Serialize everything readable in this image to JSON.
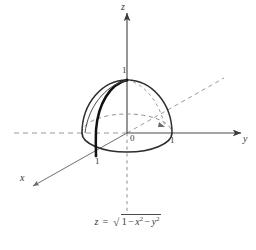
{
  "figure": {
    "kind": "3d-coordinate-axes-with-hemisphere",
    "background_color": "#ffffff",
    "line_color": "#4a4a4a",
    "dashed_color": "#8a8a8a",
    "bold_curve_color": "#1a1a1a",
    "axes": {
      "z": {
        "label": "z",
        "positive_style": "solid",
        "negative_style": "dashed",
        "arrow": true
      },
      "y": {
        "label": "y",
        "positive_style": "solid",
        "negative_style": "dashed",
        "arrow": true
      },
      "x": {
        "label": "x",
        "positive_style": "solid",
        "negative_style": "dashed",
        "arrow": true
      }
    },
    "origin_label": "0",
    "ticks": {
      "z_one": "1",
      "y_one": "1",
      "x_one": "1"
    },
    "surface": {
      "name": "upper unit hemisphere",
      "radius": 1,
      "equator_front": "solid",
      "equator_back": "dashed",
      "meridian_highlight": "bold"
    }
  },
  "caption": {
    "lhs": "z",
    "equals": "=",
    "radical_sign": "√",
    "one": "1",
    "minus_a": "−",
    "x": "x",
    "x_exp": "2",
    "minus_b": "−",
    "y": "y",
    "y_exp": "2",
    "plain_text": "z = √(1 − x² − y²)"
  }
}
